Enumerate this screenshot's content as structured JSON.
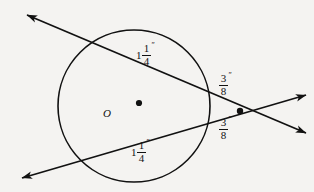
{
  "figure": {
    "kind": "geometry-diagram",
    "background_color": "#f4f3f1",
    "ink_color": "#111111"
  },
  "circle": {
    "center_label": "O",
    "center_x": 134,
    "center_y": 106,
    "radius": 76,
    "stroke_color": "#111111",
    "stroke_width": 1.6
  },
  "center_dot": {
    "name": "center-point",
    "x": 139,
    "y": 103,
    "radius": 3.1
  },
  "intersection_dot": {
    "name": "external-intersection-point",
    "x": 240,
    "y": 111,
    "radius": 3.2
  },
  "lines": [
    {
      "name": "upper-secant",
      "x1": 27,
      "y1": 15,
      "x2": 306,
      "y2": 133,
      "arrow_start": true,
      "arrow_end": true
    },
    {
      "name": "lower-secant",
      "x1": 22,
      "y1": 178,
      "x2": 306,
      "y2": 95,
      "arrow_start": true,
      "arrow_end": true
    }
  ],
  "labels": {
    "chord_upper": {
      "whole": "1",
      "numerator": "1",
      "denominator": "4",
      "unit": "″",
      "full_text": "1 1/4 in"
    },
    "chord_lower": {
      "whole": "1",
      "numerator": "1",
      "denominator": "4",
      "unit": "″",
      "full_text": "1 1/4 in"
    },
    "secant_upper_external": {
      "whole": "",
      "numerator": "3",
      "denominator": "8",
      "unit": "″",
      "full_text": "3/8 in"
    },
    "secant_lower_external": {
      "whole": "",
      "numerator": "3",
      "denominator": "8",
      "unit": "″",
      "full_text": "3/8 in"
    },
    "center": {
      "text": "O"
    }
  }
}
